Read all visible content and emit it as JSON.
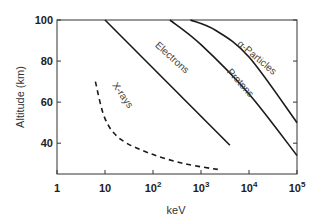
{
  "chart_data": {
    "type": "line",
    "title": "",
    "xlabel": "keV",
    "ylabel": "Altitude (km)",
    "xscale": "log",
    "xlim": [
      1,
      100000
    ],
    "ylim": [
      25,
      100
    ],
    "x_ticks": [
      {
        "value": 1,
        "base": "1",
        "exp": ""
      },
      {
        "value": 10,
        "base": "10",
        "exp": ""
      },
      {
        "value": 100,
        "base": "10",
        "exp": "2"
      },
      {
        "value": 1000,
        "base": "10",
        "exp": "3"
      },
      {
        "value": 10000,
        "base": "10",
        "exp": "4"
      },
      {
        "value": 100000,
        "base": "10",
        "exp": "5"
      }
    ],
    "y_ticks": [
      {
        "value": 40,
        "label": "40"
      },
      {
        "value": 60,
        "label": "60"
      },
      {
        "value": 80,
        "label": "80"
      },
      {
        "value": 100,
        "label": "100"
      }
    ],
    "grid": false,
    "legend": "inline labels",
    "series": [
      {
        "name": "X-rays",
        "style": "dashed",
        "points": [
          [
            6.3,
            70
          ],
          [
            10,
            52
          ],
          [
            21,
            42
          ],
          [
            87,
            35
          ],
          [
            460,
            30
          ],
          [
            2600,
            27
          ]
        ],
        "label_pos": [
          120,
          97
        ],
        "label_angle": 55
      },
      {
        "name": "Electrons",
        "style": "solid",
        "points": [
          [
            10,
            100
          ],
          [
            4000,
            39
          ]
        ],
        "label_pos": [
          170,
          60
        ],
        "label_angle": 42
      },
      {
        "name": "Protons",
        "style": "solid",
        "points": [
          [
            225,
            100
          ],
          [
            1000,
            88
          ],
          [
            10000,
            64
          ],
          [
            100000,
            34
          ]
        ],
        "label_pos": [
          238,
          85
        ],
        "label_angle": 48
      },
      {
        "name": "α-Particles",
        "style": "solid",
        "points": [
          [
            600,
            100
          ],
          [
            2000,
            95
          ],
          [
            10000,
            82
          ],
          [
            100000,
            50
          ]
        ],
        "label_pos": [
          255,
          60
        ],
        "label_angle": 40
      }
    ]
  }
}
